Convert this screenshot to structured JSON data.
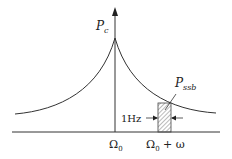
{
  "diagram": {
    "y_axis_label": "P",
    "y_axis_label_sub": "c",
    "band_label": "P",
    "band_label_sub": "ssb",
    "width_label": "1Hz",
    "x_tick_center": "Ω",
    "x_tick_center_sub": "0",
    "x_tick_offset": "Ω",
    "x_tick_offset_sub": "0",
    "x_tick_offset_suffix": " + ω",
    "colors": {
      "line": "#333333",
      "hatch": "#888888",
      "background": "#ffffff"
    }
  }
}
